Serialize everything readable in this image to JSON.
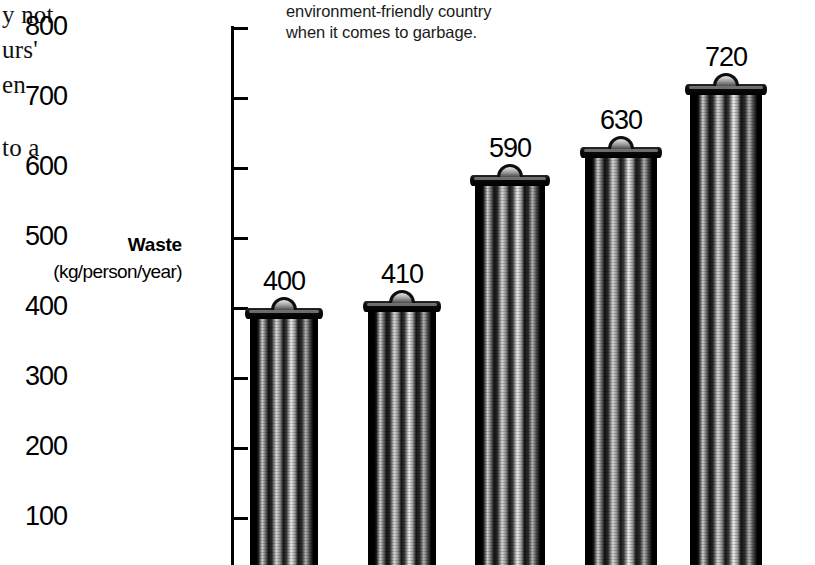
{
  "body_text": {
    "lines": [
      "y not",
      "urs'",
      "en",
      "to a"
    ]
  },
  "caption": {
    "line1": "environment-friendly country",
    "line2": "when it comes to garbage."
  },
  "axis_title": {
    "main": "Waste",
    "unit": "(kg/person/year)"
  },
  "chart_data": {
    "type": "bar",
    "title": "",
    "xlabel": "",
    "ylabel": "Waste (kg/person/year)",
    "ylim": [
      0,
      800
    ],
    "ytick_labels": [
      "800",
      "700",
      "600",
      "500",
      "400",
      "300",
      "200",
      "100"
    ],
    "ytick_values": [
      800,
      700,
      600,
      500,
      400,
      300,
      200,
      100
    ],
    "grid": false,
    "legend": "none",
    "categories": [
      "",
      "",
      "",
      "",
      ""
    ],
    "values": [
      400,
      410,
      590,
      630,
      720
    ],
    "value_labels": [
      "400",
      "410",
      "590",
      "630",
      "720"
    ],
    "bar_style": "garbage-can pictogram",
    "annotations": [
      "environment-friendly country when it comes to garbage."
    ]
  },
  "colors": {
    "background": "#ffffff",
    "ink": "#000000",
    "caption_ink": "#1a1a1a"
  }
}
